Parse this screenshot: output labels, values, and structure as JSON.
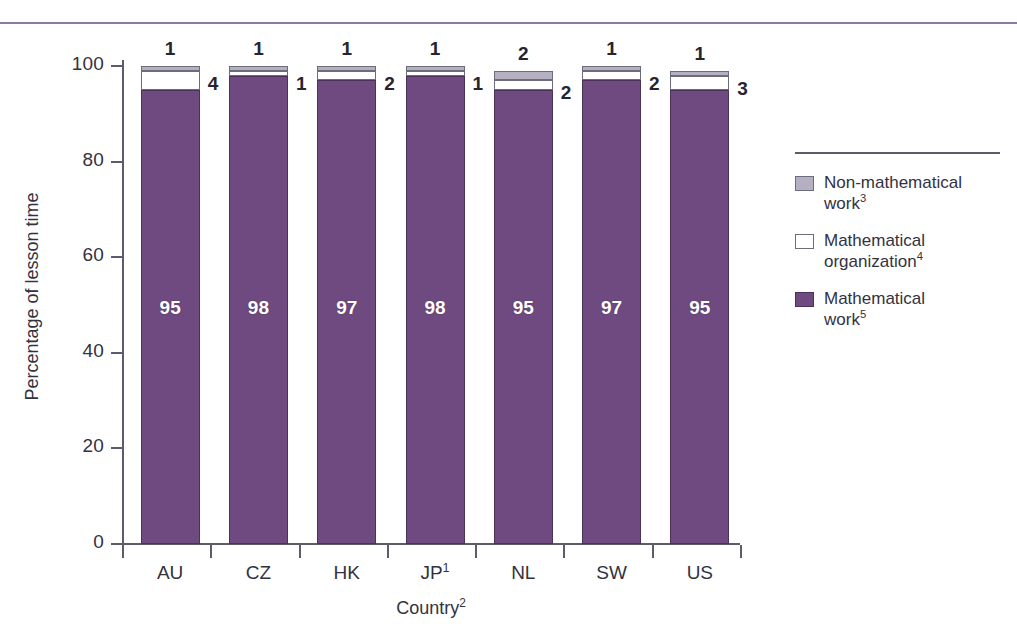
{
  "chart_data": {
    "type": "bar",
    "subtype": "stacked-100-percent",
    "title": "",
    "xlabel": "Country",
    "xlabel_sup": "2",
    "ylabel": "Percentage of lesson time",
    "ylim": [
      0,
      100
    ],
    "yticks": [
      0,
      20,
      40,
      60,
      80,
      100
    ],
    "grid": false,
    "legend_position": "right",
    "categories": [
      "AU",
      "CZ",
      "HK",
      "JP",
      "NL",
      "SW",
      "US"
    ],
    "category_sups": [
      "",
      "",
      "",
      "1",
      "",
      "",
      ""
    ],
    "series": [
      {
        "name": "Mathematical work",
        "name_sup": "5",
        "color": "#6e4a80",
        "values": [
          95,
          98,
          97,
          98,
          95,
          97,
          95
        ]
      },
      {
        "name": "Mathematical organization",
        "name_sup": "4",
        "color": "#ffffff",
        "values": [
          4,
          1,
          2,
          1,
          2,
          2,
          3
        ]
      },
      {
        "name": "Non-mathematical work",
        "name_sup": "3",
        "color": "#b5afc2",
        "values": [
          1,
          1,
          1,
          1,
          2,
          1,
          1
        ]
      }
    ]
  },
  "axis": {
    "y_title": "Percentage of lesson time",
    "y_tick_labels": [
      "0",
      "20",
      "40",
      "60",
      "80",
      "100"
    ],
    "x_title": "Country",
    "x_title_sup": "2",
    "x_tick_labels": [
      "AU",
      "CZ",
      "HK",
      "JP",
      "NL",
      "SW",
      "US"
    ]
  },
  "bars": [
    {
      "cat": "AU",
      "cat_sup": "",
      "math": "95",
      "org": "4",
      "non": "1"
    },
    {
      "cat": "CZ",
      "cat_sup": "",
      "math": "98",
      "org": "1",
      "non": "1"
    },
    {
      "cat": "HK",
      "cat_sup": "",
      "math": "97",
      "org": "2",
      "non": "1"
    },
    {
      "cat": "JP",
      "cat_sup": "1",
      "math": "98",
      "org": "1",
      "non": "1"
    },
    {
      "cat": "NL",
      "cat_sup": "",
      "math": "95",
      "org": "2",
      "non": "2"
    },
    {
      "cat": "SW",
      "cat_sup": "",
      "math": "97",
      "org": "2",
      "non": "1"
    },
    {
      "cat": "US",
      "cat_sup": "",
      "math": "95",
      "org": "3",
      "non": "1"
    }
  ],
  "legend": {
    "items": [
      {
        "swatch": "non-mathematical-swatch",
        "line1": "Non-mathematical",
        "line2": "work",
        "sup": "3"
      },
      {
        "swatch": "mathematical-organization-swatch",
        "line1": "Mathematical",
        "line2": "organization",
        "sup": "4"
      },
      {
        "swatch": "mathematical-work-swatch",
        "line1": "Mathematical",
        "line2": "work",
        "sup": "5"
      }
    ]
  },
  "colors": {
    "mathematical_work": "#6e4a80",
    "mathematical_organization": "#ffffff",
    "non_mathematical_work": "#b5afc2",
    "axis": "#5d5c6b",
    "rule": "#8c7b9e"
  }
}
